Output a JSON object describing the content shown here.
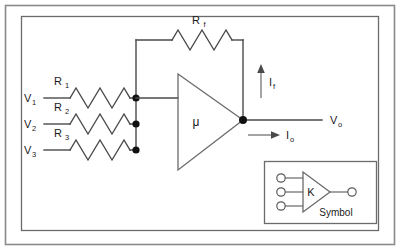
{
  "figure": {
    "title_present": false,
    "background_color": "#ffffff",
    "line_color": "#4a4a4a",
    "text_color": "#1a1a1a"
  },
  "inputs": [
    {
      "source_label": "V",
      "source_sub": "1",
      "resistor_label": "R",
      "resistor_sub": "1"
    },
    {
      "source_label": "V",
      "source_sub": "2",
      "resistor_label": "R",
      "resistor_sub": "2"
    },
    {
      "source_label": "V",
      "source_sub": "3",
      "resistor_label": "R",
      "resistor_sub": "3"
    }
  ],
  "feedback": {
    "resistor_label": "R",
    "resistor_sub": "f",
    "current_label": "I",
    "current_sub": "f",
    "current_direction": "up"
  },
  "amplifier": {
    "gain_symbol": "μ"
  },
  "output": {
    "voltage_label": "V",
    "voltage_sub": "o",
    "current_label": "I",
    "current_sub": "o",
    "current_direction": "right"
  },
  "symbol_box": {
    "caption": "Symbol",
    "gain_symbol": "K",
    "input_terminals": 3,
    "output_terminals": 1
  }
}
